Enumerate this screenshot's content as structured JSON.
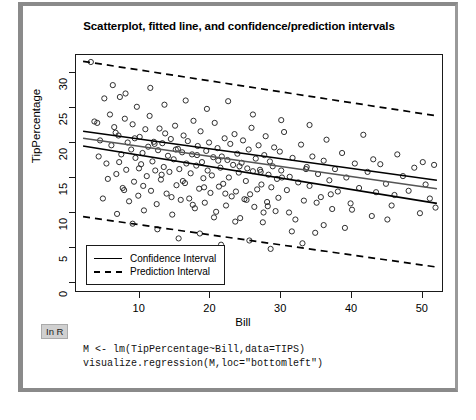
{
  "figure": {
    "title": "Scatterplot, fitted line, and confidence/prediction intervals",
    "xlabel": "Bill",
    "ylabel": "TipPercentage"
  },
  "legend": {
    "confidence_label": "Confidence Interval",
    "prediction_label": "Prediction Interval",
    "confidence_style": "solid",
    "prediction_style": "dashed"
  },
  "code": {
    "badge": "In R",
    "line1": "M <- lm(TipPercentage~Bill,data=TIPS)",
    "line2": "visualize.regression(M,loc=\"bottomleft\")"
  },
  "colors": {
    "point_stroke": "#1a1a1a",
    "line": "#000000",
    "fitted_line": "#555555",
    "frame": "#1a1a1a",
    "card_border": "#8a8a8a",
    "badge_bg": "#d0d0d0"
  },
  "chart_data": {
    "type": "scatter",
    "title": "Scatterplot, fitted line, and confidence/prediction intervals",
    "xlabel": "Bill",
    "ylabel": "TipPercentage",
    "xlim": [
      1,
      53
    ],
    "ylim": [
      -1.5,
      32.5
    ],
    "xticks": [
      10,
      20,
      30,
      40,
      50
    ],
    "yticks": [
      0,
      5,
      10,
      15,
      20,
      25,
      30
    ],
    "grid": false,
    "legend_position": "bottomleft",
    "marker": "open-circle",
    "series": [
      {
        "name": "Fitted line",
        "type": "line",
        "style": "solid",
        "color": "#555555",
        "endpoints": [
          [
            2.0,
            20.6
          ],
          [
            52.0,
            13.4
          ]
        ]
      },
      {
        "name": "Confidence Interval upper",
        "type": "line",
        "style": "solid",
        "color": "#000000",
        "endpoints": [
          [
            2.0,
            21.6
          ],
          [
            52.0,
            14.6
          ]
        ]
      },
      {
        "name": "Confidence Interval lower",
        "type": "line",
        "style": "solid",
        "color": "#000000",
        "endpoints": [
          [
            2.0,
            19.5
          ],
          [
            52.0,
            11.3
          ]
        ]
      },
      {
        "name": "Prediction Interval upper",
        "type": "line",
        "style": "dashed",
        "color": "#000000",
        "endpoints": [
          [
            2.0,
            31.6
          ],
          [
            52.0,
            23.8
          ]
        ]
      },
      {
        "name": "Prediction Interval lower",
        "type": "line",
        "style": "dashed",
        "color": "#000000",
        "endpoints": [
          [
            2.0,
            9.4
          ],
          [
            52.0,
            2.2
          ]
        ]
      }
    ],
    "points": [
      [
        3.1,
        31.5
      ],
      [
        3.6,
        23.0
      ],
      [
        4.4,
        20.3
      ],
      [
        5.0,
        26.3
      ],
      [
        5.3,
        17.0
      ],
      [
        5.8,
        24.0
      ],
      [
        6.0,
        19.6
      ],
      [
        6.4,
        22.2
      ],
      [
        6.7,
        15.5
      ],
      [
        7.0,
        21.0
      ],
      [
        7.2,
        26.5
      ],
      [
        7.4,
        18.3
      ],
      [
        7.6,
        13.5
      ],
      [
        7.9,
        23.4
      ],
      [
        8.1,
        16.1
      ],
      [
        8.3,
        20.0
      ],
      [
        8.5,
        11.6
      ],
      [
        8.8,
        19.0
      ],
      [
        9.0,
        22.6
      ],
      [
        9.2,
        14.4
      ],
      [
        9.4,
        17.8
      ],
      [
        9.6,
        25.1
      ],
      [
        9.8,
        12.4
      ],
      [
        10.0,
        20.8
      ],
      [
        10.2,
        16.9
      ],
      [
        10.4,
        18.5
      ],
      [
        10.6,
        10.3
      ],
      [
        10.8,
        21.9
      ],
      [
        11.0,
        15.2
      ],
      [
        11.2,
        19.4
      ],
      [
        11.4,
        23.8
      ],
      [
        11.6,
        13.1
      ],
      [
        11.8,
        17.3
      ],
      [
        12.0,
        20.1
      ],
      [
        12.2,
        16.0
      ],
      [
        12.4,
        11.2
      ],
      [
        12.6,
        18.9
      ],
      [
        12.8,
        22.0
      ],
      [
        13.0,
        14.7
      ],
      [
        13.2,
        19.9
      ],
      [
        13.4,
        16.5
      ],
      [
        13.6,
        21.3
      ],
      [
        13.8,
        12.7
      ],
      [
        14.0,
        18.1
      ],
      [
        14.2,
        15.8
      ],
      [
        14.4,
        20.5
      ],
      [
        14.6,
        9.7
      ],
      [
        14.8,
        17.6
      ],
      [
        15.0,
        22.4
      ],
      [
        15.2,
        13.9
      ],
      [
        15.4,
        19.1
      ],
      [
        15.6,
        16.2
      ],
      [
        15.8,
        11.8
      ],
      [
        16.0,
        18.6
      ],
      [
        16.2,
        21.0
      ],
      [
        16.4,
        14.2
      ],
      [
        16.6,
        17.0
      ],
      [
        16.8,
        20.2
      ],
      [
        17.0,
        12.0
      ],
      [
        17.2,
        15.6
      ],
      [
        17.4,
        18.3
      ],
      [
        17.6,
        23.1
      ],
      [
        17.8,
        10.6
      ],
      [
        18.0,
        16.7
      ],
      [
        18.2,
        19.5
      ],
      [
        18.4,
        13.4
      ],
      [
        18.6,
        21.6
      ],
      [
        18.8,
        17.2
      ],
      [
        19.0,
        14.9
      ],
      [
        19.2,
        11.4
      ],
      [
        19.4,
        18.8
      ],
      [
        19.6,
        16.0
      ],
      [
        19.8,
        20.0
      ],
      [
        20.0,
        12.8
      ],
      [
        20.2,
        15.3
      ],
      [
        20.4,
        17.9
      ],
      [
        20.6,
        22.8
      ],
      [
        20.8,
        10.1
      ],
      [
        21.0,
        19.2
      ],
      [
        21.2,
        13.7
      ],
      [
        21.4,
        16.4
      ],
      [
        21.6,
        18.0
      ],
      [
        21.8,
        14.1
      ],
      [
        22.0,
        20.6
      ],
      [
        22.2,
        11.0
      ],
      [
        22.4,
        17.5
      ],
      [
        22.6,
        15.0
      ],
      [
        22.8,
        19.8
      ],
      [
        23.0,
        12.3
      ],
      [
        23.2,
        16.8
      ],
      [
        23.4,
        21.2
      ],
      [
        23.6,
        13.0
      ],
      [
        23.8,
        18.4
      ],
      [
        24.0,
        15.7
      ],
      [
        24.2,
        9.2
      ],
      [
        24.4,
        17.1
      ],
      [
        24.6,
        20.3
      ],
      [
        24.8,
        11.9
      ],
      [
        25.0,
        14.5
      ],
      [
        25.2,
        16.3
      ],
      [
        25.4,
        19.0
      ],
      [
        25.6,
        12.6
      ],
      [
        25.8,
        22.1
      ],
      [
        26.0,
        15.9
      ],
      [
        26.2,
        10.8
      ],
      [
        26.4,
        17.7
      ],
      [
        26.6,
        13.3
      ],
      [
        26.8,
        19.6
      ],
      [
        27.0,
        16.1
      ],
      [
        27.2,
        14.0
      ],
      [
        27.4,
        8.6
      ],
      [
        27.6,
        18.2
      ],
      [
        27.8,
        20.9
      ],
      [
        28.0,
        11.5
      ],
      [
        28.2,
        15.4
      ],
      [
        28.4,
        17.3
      ],
      [
        28.6,
        13.6
      ],
      [
        28.8,
        16.6
      ],
      [
        29.0,
        19.3
      ],
      [
        29.2,
        10.2
      ],
      [
        29.4,
        14.8
      ],
      [
        29.6,
        12.1
      ],
      [
        29.8,
        18.7
      ],
      [
        30.0,
        16.0
      ],
      [
        30.4,
        21.5
      ],
      [
        30.8,
        13.2
      ],
      [
        31.2,
        15.1
      ],
      [
        31.6,
        17.8
      ],
      [
        32.0,
        9.0
      ],
      [
        32.4,
        14.3
      ],
      [
        32.8,
        19.7
      ],
      [
        33.2,
        11.7
      ],
      [
        33.6,
        16.5
      ],
      [
        34.0,
        13.8
      ],
      [
        34.4,
        18.0
      ],
      [
        34.8,
        7.1
      ],
      [
        35.2,
        15.5
      ],
      [
        35.6,
        12.2
      ],
      [
        36.0,
        17.4
      ],
      [
        36.4,
        20.4
      ],
      [
        36.8,
        14.6
      ],
      [
        37.2,
        10.5
      ],
      [
        37.6,
        16.2
      ],
      [
        38.0,
        13.0
      ],
      [
        38.6,
        18.5
      ],
      [
        39.2,
        15.0
      ],
      [
        39.8,
        11.3
      ],
      [
        40.4,
        17.0
      ],
      [
        41.0,
        13.5
      ],
      [
        41.6,
        21.1
      ],
      [
        42.2,
        15.8
      ],
      [
        42.8,
        9.5
      ],
      [
        43.4,
        12.9
      ],
      [
        44.0,
        16.9
      ],
      [
        44.8,
        14.1
      ],
      [
        45.6,
        11.0
      ],
      [
        46.4,
        18.3
      ],
      [
        47.2,
        15.2
      ],
      [
        48.0,
        13.1
      ],
      [
        48.8,
        16.4
      ],
      [
        49.6,
        9.9
      ],
      [
        50.4,
        14.0
      ],
      [
        51.0,
        12.0
      ],
      [
        51.6,
        16.8
      ],
      [
        6.2,
        28.2
      ],
      [
        8.0,
        27.0
      ],
      [
        11.5,
        27.8
      ],
      [
        13.5,
        25.4
      ],
      [
        16.5,
        26.0
      ],
      [
        19.5,
        24.8
      ],
      [
        22.5,
        25.9
      ],
      [
        26.0,
        24.0
      ],
      [
        30.0,
        23.2
      ],
      [
        34.0,
        22.5
      ],
      [
        4.8,
        12.0
      ],
      [
        6.8,
        9.8
      ],
      [
        9.0,
        8.4
      ],
      [
        12.5,
        7.6
      ],
      [
        15.5,
        6.3
      ],
      [
        18.5,
        7.0
      ],
      [
        21.5,
        5.4
      ],
      [
        25.5,
        6.0
      ],
      [
        28.5,
        4.8
      ],
      [
        33.0,
        5.6
      ],
      [
        5.5,
        14.8
      ],
      [
        7.8,
        13.2
      ],
      [
        10.5,
        13.8
      ],
      [
        14.5,
        12.2
      ],
      [
        17.5,
        11.1
      ],
      [
        20.5,
        9.3
      ],
      [
        23.5,
        8.7
      ],
      [
        27.5,
        10.0
      ],
      [
        31.5,
        7.3
      ],
      [
        36.0,
        8.2
      ],
      [
        4.2,
        18.0
      ],
      [
        7.1,
        17.2
      ],
      [
        9.9,
        16.3
      ],
      [
        13.1,
        15.4
      ],
      [
        16.1,
        14.5
      ],
      [
        19.1,
        13.6
      ],
      [
        22.1,
        12.7
      ],
      [
        25.1,
        11.8
      ],
      [
        28.1,
        10.9
      ],
      [
        31.1,
        10.0
      ],
      [
        4.0,
        22.8
      ],
      [
        6.6,
        21.4
      ],
      [
        9.3,
        20.6
      ],
      [
        12.1,
        19.8
      ],
      [
        15.1,
        19.0
      ],
      [
        18.1,
        18.2
      ],
      [
        21.1,
        17.4
      ],
      [
        24.1,
        16.6
      ],
      [
        27.1,
        15.8
      ],
      [
        30.1,
        15.0
      ],
      [
        33.5,
        16.2
      ],
      [
        37.0,
        12.6
      ],
      [
        40.0,
        10.4
      ],
      [
        43.0,
        17.6
      ],
      [
        46.0,
        12.5
      ],
      [
        50.0,
        17.2
      ],
      [
        51.8,
        10.7
      ],
      [
        45.0,
        9.0
      ],
      [
        39.0,
        7.8
      ],
      [
        35.0,
        11.4
      ]
    ]
  }
}
